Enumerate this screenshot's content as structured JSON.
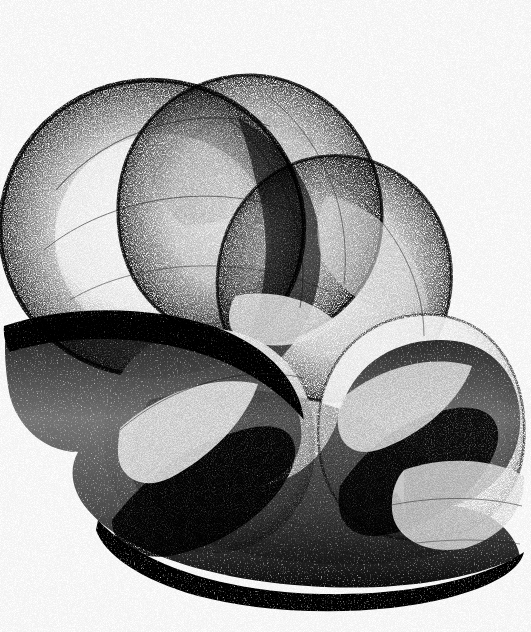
{
  "artwork": {
    "title": "Untitled Stipple Composition",
    "medium": "generative stipple / pointillist ink",
    "palette": {
      "background": "#ffffff",
      "ink": "#111111",
      "mid_tone": "#6f6f6f",
      "light_tone": "#c9c9c9",
      "deep_shadow": "#0a0a0a"
    },
    "canvas": {
      "width": 531,
      "height": 632
    },
    "composition": {
      "description": "Overlapping translucent lobes of stippled ink forming a folded wave band across the lower half, with three large circular lobes in the upper half.",
      "structure": "z-fold-wave",
      "lobe_count": 5,
      "texture": "stipple"
    }
  },
  "chart_data": {
    "type": "scatter",
    "title": "Untitled Stipple Composition",
    "xlabel": "",
    "ylabel": "",
    "xlim": [
      0,
      531
    ],
    "ylim": [
      0,
      632
    ],
    "grid": false,
    "legend": "none",
    "series": [
      {
        "name": "lobe-upper-left-ring",
        "center": [
          150,
          225
        ],
        "radius": 150,
        "density": 0.42,
        "tone": "#6f6f6f"
      },
      {
        "name": "lobe-upper-left-core",
        "center": [
          160,
          235
        ],
        "radius": 105,
        "density": 0.06,
        "tone": "#ededed"
      },
      {
        "name": "lobe-upper-mid",
        "center": [
          250,
          215
        ],
        "radius": 140,
        "density": 0.4,
        "tone": "#707070"
      },
      {
        "name": "lobe-upper-right",
        "center": [
          330,
          275
        ],
        "radius": 130,
        "density": 0.45,
        "tone": "#5e5e5e"
      },
      {
        "name": "lobe-lower-right",
        "center": [
          420,
          430
        ],
        "radius": 120,
        "density": 0.22,
        "tone": "#a8a8a8"
      },
      {
        "name": "lobe-lower-left",
        "center": [
          215,
          430
        ],
        "radius": 120,
        "density": 0.2,
        "tone": "#b0b0b0"
      },
      {
        "name": "fold-band-dark",
        "center": [
          250,
          430
        ],
        "radius": 0,
        "density": 0.92,
        "tone": "#0d0d0d"
      }
    ],
    "annotations": []
  }
}
